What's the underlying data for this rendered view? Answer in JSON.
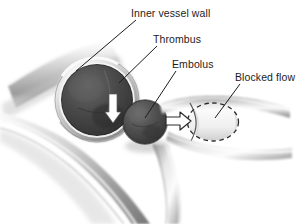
{
  "figure": {
    "background_color": "#ffffff",
    "width": 307,
    "height": 224,
    "style": "grayscale medical line illustration"
  },
  "labels": [
    {
      "id": "inner-vessel-wall",
      "text": "Inner vessel wall",
      "x": 131,
      "y": 7,
      "leader_from": [
        136,
        20
      ],
      "leader_to": [
        76,
        71
      ]
    },
    {
      "id": "thrombus",
      "text": "Thrombus",
      "x": 153,
      "y": 33,
      "leader_from": [
        157,
        46
      ],
      "leader_to": [
        119,
        83
      ]
    },
    {
      "id": "embolus",
      "text": "Embolus",
      "x": 172,
      "y": 58,
      "leader_from": [
        176,
        71
      ],
      "leader_to": [
        145,
        118
      ]
    },
    {
      "id": "blocked-flow",
      "text": "Blocked flow",
      "x": 235,
      "y": 71,
      "leader_from": [
        240,
        84
      ],
      "leader_to": [
        215,
        118
      ]
    }
  ],
  "anatomy": {
    "vessel_lumen": {
      "name": "vessel opening cross-section",
      "center": [
        97,
        100
      ],
      "radius": 41,
      "rim_color": "#c9c9c9",
      "rim_highlight": "#f0f0f0"
    },
    "thrombus": {
      "name": "thrombus attached to vessel wall",
      "center": [
        98,
        99
      ],
      "radius": 33,
      "color": "#4a4a4a"
    },
    "embolus": {
      "name": "detached embolus fragment",
      "center": [
        145,
        122
      ],
      "radius": 22,
      "color": "#4f4f4f"
    },
    "blocked_flow": {
      "name": "blocked flow region",
      "center": [
        213,
        122
      ],
      "rx": 26,
      "ry": 19,
      "outline": "dashed",
      "fill_color": "#ededed"
    },
    "flow_arrow": {
      "name": "blocked flow direction arrow",
      "direction": "right",
      "x": 178,
      "y": 122
    },
    "detach_arrow": {
      "name": "embolus detachment arrow",
      "direction": "down",
      "color": "#ffffff",
      "x": 113,
      "y": 108
    }
  },
  "colors": {
    "ink": "#1c1c1c",
    "vessel_wall_light": "#e2e2e2",
    "vessel_wall_mid": "#a8a8a8",
    "vessel_wall_dark": "#6e6e6e",
    "clot_dark": "#3f3f3f",
    "background": "#ffffff"
  }
}
